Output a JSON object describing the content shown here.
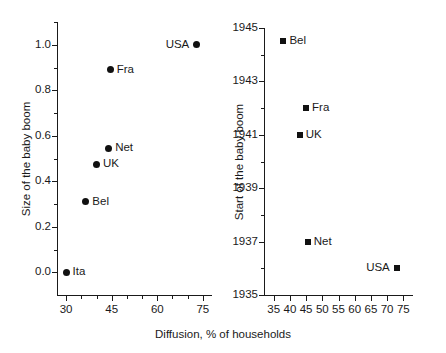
{
  "figure": {
    "width": 446,
    "height": 353,
    "background": "#ffffff",
    "marker_color": "#111111",
    "axis_color": "#1a1a1a",
    "shared_xlabel": "Diffusion, % of households"
  },
  "chart_data": [
    {
      "type": "scatter",
      "panel": "left",
      "title": "",
      "xlabel": "Diffusion, % of households",
      "ylabel": "Size of the baby boom",
      "xlim": [
        27,
        78
      ],
      "ylim": [
        -0.1,
        1.1
      ],
      "xticks": [
        30,
        45,
        60,
        75
      ],
      "xticklabels": [
        "30",
        "45",
        "60",
        "75"
      ],
      "xminorticks": [
        35,
        40,
        50,
        55,
        65,
        70
      ],
      "yticks": [
        0.0,
        0.2,
        0.4,
        0.6,
        0.8,
        1.0
      ],
      "yticklabels": [
        "0.0",
        "0.2",
        "0.4",
        "0.6",
        "0.8",
        "1.0"
      ],
      "yminorticks": [
        0.1,
        0.3,
        0.5,
        0.7,
        0.9,
        1.1
      ],
      "grid": false,
      "legend": "none",
      "marker": "circle",
      "points": [
        {
          "label": "Ita",
          "x": 30.0,
          "y": 0.0,
          "label_side": "right"
        },
        {
          "label": "Bel",
          "x": 36.5,
          "y": 0.31,
          "label_side": "right"
        },
        {
          "label": "UK",
          "x": 40.0,
          "y": 0.475,
          "label_side": "right"
        },
        {
          "label": "Net",
          "x": 44.0,
          "y": 0.545,
          "label_side": "right"
        },
        {
          "label": "Fra",
          "x": 44.5,
          "y": 0.89,
          "label_side": "right"
        },
        {
          "label": "USA",
          "x": 73.0,
          "y": 1.0,
          "label_side": "left"
        }
      ]
    },
    {
      "type": "scatter",
      "panel": "right",
      "title": "",
      "xlabel": "Diffusion, % of households",
      "ylabel": "Start of the baby boom",
      "xlim": [
        32,
        78
      ],
      "ylim": [
        1935,
        1945
      ],
      "xticks": [
        35,
        40,
        45,
        50,
        55,
        60,
        65,
        70,
        75
      ],
      "xticklabels": [
        "35",
        "40",
        "45",
        "50",
        "55",
        "60",
        "65",
        "70",
        "75"
      ],
      "yticks": [
        1935,
        1937,
        1939,
        1941,
        1943,
        1945
      ],
      "yticklabels": [
        "1935",
        "1937",
        "1939",
        "1941",
        "1943",
        "1945"
      ],
      "yminorticks": [
        1936,
        1938,
        1940,
        1942,
        1944
      ],
      "grid": false,
      "legend": "none",
      "marker": "square",
      "points": [
        {
          "label": "Bel",
          "x": 38.0,
          "y": 1944.5,
          "label_side": "right"
        },
        {
          "label": "Fra",
          "x": 45.0,
          "y": 1942.0,
          "label_side": "right"
        },
        {
          "label": "UK",
          "x": 43.0,
          "y": 1941.0,
          "label_side": "right"
        },
        {
          "label": "Net",
          "x": 45.5,
          "y": 1937.0,
          "label_side": "right"
        },
        {
          "label": "USA",
          "x": 73.0,
          "y": 1936.0,
          "label_side": "left"
        }
      ]
    }
  ]
}
